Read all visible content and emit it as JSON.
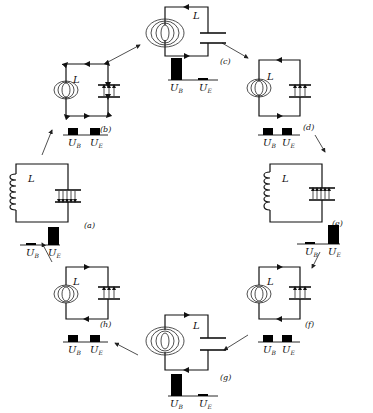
{
  "inductor_label": "L",
  "energy_labels": {
    "magnetic": "U",
    "magnetic_sub": "B",
    "electric": "U",
    "electric_sub": "E"
  },
  "panels": [
    {
      "id": "a",
      "caption": "(a)",
      "state": "capacitor fully charged, no current",
      "UB": 0.05,
      "UE": 1.0
    },
    {
      "id": "b",
      "caption": "(b)",
      "state": "half energy each, discharging",
      "UB": 0.5,
      "UE": 0.5
    },
    {
      "id": "c",
      "caption": "(c)",
      "state": "max current, capacitor empty",
      "UB": 1.0,
      "UE": 0.05
    },
    {
      "id": "d",
      "caption": "(d)",
      "state": "half energy each, charging reverse",
      "UB": 0.5,
      "UE": 0.5
    },
    {
      "id": "e",
      "caption": "(e)",
      "state": "capacitor fully charged reversed, no current",
      "UB": 0.05,
      "UE": 1.0
    },
    {
      "id": "f",
      "caption": "(f)",
      "state": "half energy each, discharging",
      "UB": 0.5,
      "UE": 0.5
    },
    {
      "id": "g",
      "caption": "(g)",
      "state": "max current reversed, capacitor empty",
      "UB": 1.0,
      "UE": 0.05
    },
    {
      "id": "h",
      "caption": "(h)",
      "state": "half energy each, charging",
      "UB": 0.5,
      "UE": 0.5
    }
  ],
  "colors": {
    "ink": "#111111",
    "background": "#ffffff"
  }
}
